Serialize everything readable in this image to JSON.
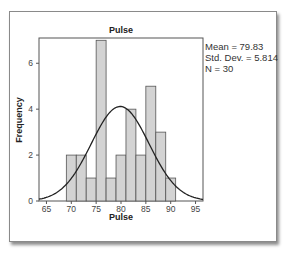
{
  "chart_data": {
    "type": "bar",
    "title": "Pulse",
    "xlabel": "Pulse",
    "ylabel": "Frequency",
    "bin_edges": [
      69,
      71,
      73,
      75,
      77,
      79,
      81,
      83,
      85,
      87,
      89,
      91
    ],
    "categories": [
      "69-71",
      "71-73",
      "73-75",
      "75-77",
      "77-79",
      "79-81",
      "81-83",
      "83-85",
      "85-87",
      "87-89",
      "89-91"
    ],
    "values": [
      2,
      2,
      1,
      7,
      1,
      2,
      4,
      2,
      5,
      3,
      1
    ],
    "xlim": [
      63.5,
      96.5
    ],
    "ylim": [
      0,
      7.1
    ],
    "x_ticks": [
      65,
      70,
      75,
      80,
      85,
      90,
      95
    ],
    "y_ticks": [
      0,
      2,
      4,
      6
    ],
    "overlay": {
      "type": "normal_curve",
      "mean": 79.83,
      "std": 5.814,
      "n": 30,
      "bin_width": 2
    },
    "annotations": [
      "Mean = 79.83",
      "Std. Dev. = 5.814",
      "N = 30"
    ],
    "grid": false,
    "legend": "none",
    "colors": {
      "bar_fill": "#d3d3d3",
      "bar_edge": "#555555",
      "curve": "#222222",
      "frame": "#555555"
    }
  },
  "stats": {
    "mean_label": "Mean = 79.83",
    "std_label": "Std. Dev. = 5.814",
    "n_label": "N = 30"
  }
}
